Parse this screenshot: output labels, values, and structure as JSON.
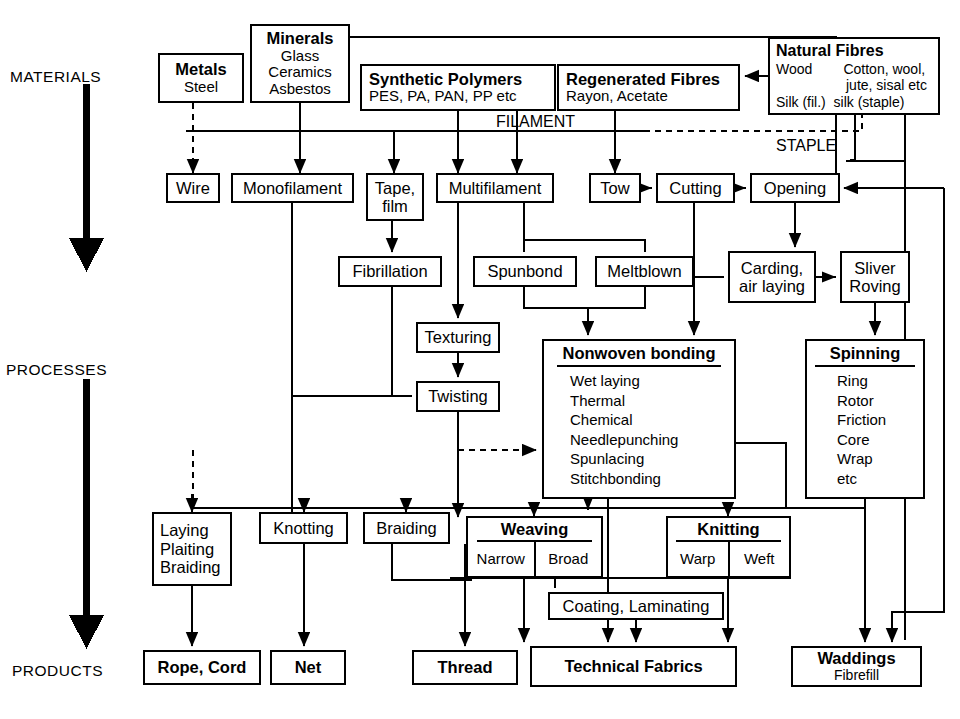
{
  "diagram": {
    "stage_labels": [
      {
        "id": "materials",
        "text": "MATERIALS",
        "x": 10,
        "y": 68
      },
      {
        "id": "processes",
        "text": "PROCESSES",
        "x": 6,
        "y": 361
      },
      {
        "id": "products",
        "text": "PRODUCTS",
        "x": 12,
        "y": 662
      }
    ],
    "free_labels": [
      {
        "id": "filament",
        "text": "FILAMENT",
        "x": 496,
        "y": 117
      },
      {
        "id": "staple",
        "text": "STAPLE",
        "x": 776,
        "y": 141
      }
    ],
    "materials": [
      {
        "id": "metals",
        "title": "Metals",
        "lines": [
          "Steel"
        ],
        "x": 158,
        "y": 53,
        "w": 86,
        "h": 50
      },
      {
        "id": "minerals",
        "title": "Minerals",
        "lines": [
          "Glass",
          "Ceramics",
          "Asbestos"
        ],
        "x": 250,
        "y": 24,
        "w": 100,
        "h": 79
      },
      {
        "id": "synthetic-polymers",
        "title": "Synthetic Polymers",
        "lines": [
          "PES, PA, PAN, PP etc"
        ],
        "x": 360,
        "y": 64,
        "w": 196,
        "h": 47
      },
      {
        "id": "regenerated-fibres",
        "title": "Regenerated Fibres",
        "lines": [
          "Rayon, Acetate"
        ],
        "x": 557,
        "y": 64,
        "w": 183,
        "h": 47
      },
      {
        "id": "natural-fibres",
        "title": "Natural Fibres",
        "lines": [
          "Wood        Cotton, wool,",
          "                  jute, sisal etc",
          "Silk (fil.)  silk (staple)"
        ],
        "x": 768,
        "y": 37,
        "w": 172,
        "h": 78
      }
    ],
    "processes": [
      {
        "id": "wire",
        "label": "Wire",
        "x": 166,
        "y": 173,
        "w": 54,
        "h": 30
      },
      {
        "id": "monofilament",
        "label": "Monofilament",
        "x": 231,
        "y": 173,
        "w": 123,
        "h": 30
      },
      {
        "id": "tape-film",
        "label": "Tape,\nfilm",
        "line1": "Tape,",
        "line2": "film",
        "x": 366,
        "y": 173,
        "w": 58,
        "h": 48
      },
      {
        "id": "multifilament",
        "label": "Multifilament",
        "x": 436,
        "y": 173,
        "w": 118,
        "h": 30
      },
      {
        "id": "tow",
        "label": "Tow",
        "x": 589,
        "y": 173,
        "w": 52,
        "h": 30
      },
      {
        "id": "cutting",
        "label": "Cutting",
        "x": 656,
        "y": 173,
        "w": 79,
        "h": 30
      },
      {
        "id": "opening",
        "label": "Opening",
        "x": 750,
        "y": 173,
        "w": 90,
        "h": 30
      },
      {
        "id": "fibrillation",
        "label": "Fibrillation",
        "x": 338,
        "y": 256,
        "w": 104,
        "h": 31
      },
      {
        "id": "spunbond",
        "label": "Spunbond",
        "x": 473,
        "y": 256,
        "w": 104,
        "h": 31
      },
      {
        "id": "meltblown",
        "label": "Meltblown",
        "x": 595,
        "y": 256,
        "w": 99,
        "h": 31
      },
      {
        "id": "carding-air-laying",
        "label": "Carding,\nair laying",
        "line1": "Carding,",
        "line2": "air laying",
        "x": 728,
        "y": 251,
        "w": 88,
        "h": 52
      },
      {
        "id": "sliver-roving",
        "label": "Sliver\nRoving",
        "line1": "Sliver",
        "line2": "Roving",
        "x": 840,
        "y": 251,
        "w": 70,
        "h": 52
      },
      {
        "id": "texturing",
        "label": "Texturing",
        "x": 416,
        "y": 322,
        "w": 84,
        "h": 31
      },
      {
        "id": "twisting",
        "label": "Twisting",
        "x": 416,
        "y": 381,
        "w": 84,
        "h": 31
      },
      {
        "id": "laying-plaiting-braiding",
        "label": "Laying\nPlaiting\nBraiding",
        "line1": "Laying",
        "line2": "Plaiting",
        "line3": "Braiding",
        "x": 152,
        "y": 512,
        "w": 80,
        "h": 74
      },
      {
        "id": "knotting",
        "label": "Knotting",
        "x": 259,
        "y": 512,
        "w": 89,
        "h": 32
      },
      {
        "id": "braiding",
        "label": "Braiding",
        "x": 363,
        "y": 512,
        "w": 87,
        "h": 32
      },
      {
        "id": "coating-laminating",
        "label": "Coating, Laminating",
        "x": 548,
        "y": 592,
        "w": 176,
        "h": 28
      }
    ],
    "nonwoven_bonding": {
      "id": "nonwoven-bonding",
      "title": "Nonwoven bonding",
      "items": [
        "Wet laying",
        "Thermal",
        "Chemical",
        "Needlepunching",
        "Spunlacing",
        "Stitchbonding"
      ],
      "x": 542,
      "y": 339,
      "w": 194,
      "h": 160
    },
    "spinning": {
      "id": "spinning",
      "title": "Spinning",
      "items": [
        "Ring",
        "Rotor",
        "Friction",
        "Core",
        "Wrap",
        "etc"
      ],
      "x": 805,
      "y": 339,
      "w": 120,
      "h": 160
    },
    "weaving": {
      "id": "weaving",
      "title": "Weaving",
      "cells": [
        "Narrow",
        "Broad"
      ],
      "x": 466,
      "y": 516,
      "w": 137,
      "h": 62
    },
    "knitting": {
      "id": "knitting",
      "title": "Knitting",
      "cells": [
        "Warp",
        "Weft"
      ],
      "x": 666,
      "y": 516,
      "w": 125,
      "h": 62
    },
    "products": [
      {
        "id": "rope-cord",
        "title": "Rope, Cord",
        "sub": "",
        "x": 143,
        "y": 650,
        "w": 118,
        "h": 35
      },
      {
        "id": "net",
        "title": "Net",
        "sub": "",
        "x": 270,
        "y": 650,
        "w": 76,
        "h": 35
      },
      {
        "id": "thread",
        "title": "Thread",
        "sub": "",
        "x": 412,
        "y": 650,
        "w": 106,
        "h": 35
      },
      {
        "id": "technical-fabrics",
        "title": "Technical Fabrics",
        "sub": "",
        "x": 530,
        "y": 646,
        "w": 207,
        "h": 41
      },
      {
        "id": "waddings",
        "title": "Waddings",
        "sub": "Fibrefill",
        "x": 791,
        "y": 646,
        "w": 131,
        "h": 41
      }
    ],
    "colors": {
      "stroke": "#000000",
      "background": "#ffffff",
      "text": "#000000"
    }
  }
}
